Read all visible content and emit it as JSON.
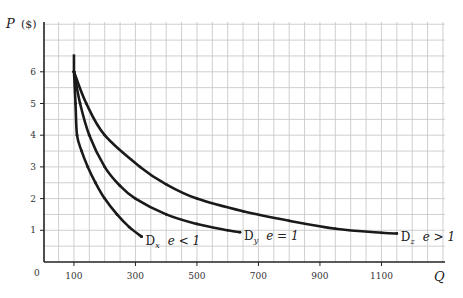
{
  "chart_data": {
    "type": "line",
    "title": "",
    "xlabel": "Q",
    "ylabel": "P ($)",
    "ylabel_main": "P",
    "ylabel_unit": "($)",
    "xlim": [
      0,
      1250
    ],
    "ylim": [
      0,
      7
    ],
    "grid": true,
    "grid_step_x": 50,
    "grid_step_y": 0.5,
    "x_ticks": [
      100,
      300,
      500,
      700,
      900,
      1100
    ],
    "x_tick_labels": [
      "100",
      "300",
      "500",
      "700",
      "900",
      "1100"
    ],
    "y_ticks": [
      1,
      2,
      3,
      4,
      5,
      6
    ],
    "y_tick_labels": [
      "1",
      "2",
      "3",
      "4",
      "5",
      "6"
    ],
    "origin_label": "0",
    "vertical_segment": {
      "x": 100,
      "y_from": 6,
      "y_to": 6.55
    },
    "series": [
      {
        "name": "Dx",
        "label_main": "D",
        "label_sub": "x",
        "label_e": "e < 1",
        "elasticity": "e < 1",
        "x": [
          100,
          105,
          110,
          125,
          145,
          170,
          200,
          240,
          280,
          320
        ],
        "y": [
          6,
          5,
          4,
          3.5,
          3,
          2.5,
          2,
          1.5,
          1.1,
          0.8
        ]
      },
      {
        "name": "Dy",
        "label_main": "D",
        "label_sub": "y",
        "label_e": "e = 1",
        "elasticity": "e = 1",
        "x": [
          100,
          120,
          150,
          200,
          250,
          300,
          400,
          500,
          600,
          640
        ],
        "y": [
          6,
          5,
          4,
          3,
          2.4,
          2,
          1.5,
          1.2,
          1,
          0.94
        ]
      },
      {
        "name": "Dz",
        "label_main": "D",
        "label_sub": "z",
        "label_e": "e > 1",
        "elasticity": "e > 1",
        "x": [
          100,
          140,
          200,
          315,
          400,
          500,
          650,
          800,
          950,
          1100,
          1150
        ],
        "y": [
          6,
          5,
          4,
          3,
          2.45,
          2,
          1.6,
          1.3,
          1.05,
          0.92,
          0.9
        ]
      }
    ]
  }
}
